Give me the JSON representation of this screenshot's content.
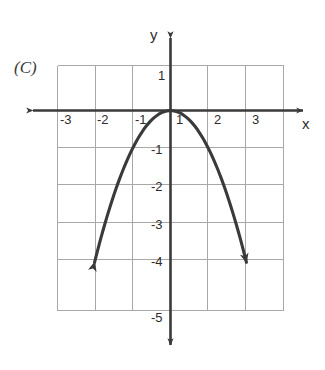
{
  "figure": {
    "panel_label": "(C)",
    "axis_labels": {
      "x": "x",
      "y": "y"
    },
    "colors": {
      "background": "#ffffff",
      "grid": "#a8a8a8",
      "axis": "#3a3a3a",
      "curve": "#3a3a3a",
      "text": "#2b2b2b"
    }
  },
  "chart_data": {
    "type": "line",
    "title": "(C)",
    "xlabel": "x",
    "ylabel": "y",
    "grid": true,
    "legend": "none",
    "equation": "y = -x^2",
    "xlim": [
      -3.5,
      3.5
    ],
    "ylim": [
      -5.2,
      1.5
    ],
    "x_ticks": [
      -3,
      -2,
      -1,
      1,
      2,
      3
    ],
    "x_tick_labels": [
      "-3",
      "-2",
      "-1",
      "1",
      "2",
      "3"
    ],
    "y_ticks": [
      1,
      -1,
      -2,
      -3,
      -4,
      -5
    ],
    "y_tick_labels": [
      "1",
      "-1",
      "-2",
      "-3",
      "-4",
      "-5"
    ],
    "grid_x_lines": [
      -3,
      -2,
      -1,
      0,
      1,
      2,
      3
    ],
    "grid_y_lines": [
      1,
      0,
      -1,
      -2,
      -3,
      -4,
      -5
    ],
    "series": [
      {
        "name": "parabola",
        "arrow_start": true,
        "arrow_end": true,
        "x": [
          -2.02,
          -1.9,
          -1.8,
          -1.7,
          -1.6,
          -1.5,
          -1.4,
          -1.3,
          -1.2,
          -1.1,
          -1.0,
          -0.9,
          -0.8,
          -0.7,
          -0.6,
          -0.5,
          -0.4,
          -0.3,
          -0.2,
          -0.1,
          0.0,
          0.1,
          0.2,
          0.3,
          0.4,
          0.5,
          0.6,
          0.7,
          0.8,
          0.9,
          1.0,
          1.1,
          1.2,
          1.3,
          1.4,
          1.5,
          1.6,
          1.7,
          1.8,
          1.9,
          2.02
        ],
        "values": [
          -4.08,
          -3.61,
          -3.24,
          -2.89,
          -2.56,
          -2.25,
          -1.96,
          -1.69,
          -1.44,
          -1.21,
          -1.0,
          -0.81,
          -0.64,
          -0.49,
          -0.36,
          -0.25,
          -0.16,
          -0.09,
          -0.04,
          -0.01,
          0.0,
          -0.01,
          -0.04,
          -0.09,
          -0.16,
          -0.25,
          -0.36,
          -0.49,
          -0.64,
          -0.81,
          -1.0,
          -1.21,
          -1.44,
          -1.69,
          -1.96,
          -2.25,
          -2.56,
          -2.89,
          -3.24,
          -3.61,
          -4.08
        ]
      }
    ],
    "annotations": [
      {
        "text": "(C)",
        "x": -3.9,
        "y": 1.25
      }
    ]
  },
  "tick_positions": {
    "x": [
      {
        "label": "-3",
        "left": 60,
        "top": 113
      },
      {
        "label": "-2",
        "left": 97,
        "top": 113
      },
      {
        "label": "-1",
        "left": 135,
        "top": 113
      },
      {
        "label": "1",
        "left": 176,
        "top": 113
      },
      {
        "label": "2",
        "left": 214,
        "top": 113
      },
      {
        "label": "3",
        "left": 252,
        "top": 113
      }
    ],
    "y": [
      {
        "label": "1",
        "left": 157,
        "top": 69
      },
      {
        "label": "-1",
        "left": 150,
        "top": 143
      },
      {
        "label": "-2",
        "left": 150,
        "top": 180
      },
      {
        "label": "-3",
        "left": 150,
        "top": 218
      },
      {
        "label": "-4",
        "left": 150,
        "top": 255
      },
      {
        "label": "-5",
        "left": 150,
        "top": 311
      }
    ]
  }
}
